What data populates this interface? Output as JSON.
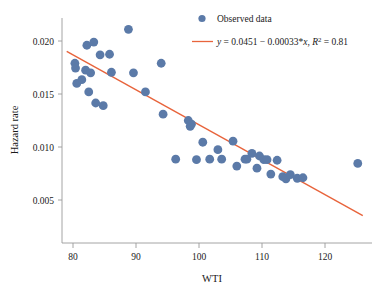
{
  "chart_data": {
    "type": "scatter",
    "title": "",
    "xlabel": "WTI",
    "ylabel": "Hazard rate",
    "xlim": [
      78.2,
      127.5
    ],
    "ylim": [
      0.0035,
      0.0215
    ],
    "grid": false,
    "legend_position": "top-right",
    "xticks": [
      80,
      90,
      100,
      110,
      120
    ],
    "xtick_labels": [
      "80",
      "90",
      "100",
      "110",
      "120"
    ],
    "yticks": [
      0.005,
      0.01,
      0.015,
      0.02
    ],
    "ytick_labels": [
      "0.005",
      "0.010",
      "0.015",
      "0.020"
    ],
    "series": [
      {
        "name": "Observed data",
        "type": "scatter",
        "color": "#5b7aa8",
        "marker": "circle",
        "marker_size": 4.4,
        "points": [
          [
            80.3,
            0.0179
          ],
          [
            80.4,
            0.01745
          ],
          [
            80.6,
            0.016
          ],
          [
            81.4,
            0.01635
          ],
          [
            82.0,
            0.01725
          ],
          [
            82.2,
            0.0196
          ],
          [
            82.5,
            0.0152
          ],
          [
            82.8,
            0.017
          ],
          [
            83.3,
            0.0199
          ],
          [
            83.6,
            0.01415
          ],
          [
            84.3,
            0.0187
          ],
          [
            84.8,
            0.0139
          ],
          [
            85.8,
            0.01875
          ],
          [
            86.1,
            0.01705
          ],
          [
            88.8,
            0.0211
          ],
          [
            89.6,
            0.017
          ],
          [
            91.5,
            0.0152
          ],
          [
            94.0,
            0.0179
          ],
          [
            94.3,
            0.0131
          ],
          [
            96.3,
            0.00885
          ],
          [
            98.3,
            0.0125
          ],
          [
            98.6,
            0.01195
          ],
          [
            98.8,
            0.01215
          ],
          [
            99.6,
            0.0088
          ],
          [
            100.6,
            0.01045
          ],
          [
            101.7,
            0.00885
          ],
          [
            103.0,
            0.00975
          ],
          [
            103.6,
            0.00885
          ],
          [
            105.4,
            0.01055
          ],
          [
            106.0,
            0.0082
          ],
          [
            107.3,
            0.00885
          ],
          [
            107.6,
            0.00885
          ],
          [
            108.4,
            0.0094
          ],
          [
            109.2,
            0.008
          ],
          [
            109.6,
            0.00915
          ],
          [
            110.3,
            0.0088
          ],
          [
            110.8,
            0.0088
          ],
          [
            111.4,
            0.00745
          ],
          [
            112.4,
            0.00875
          ],
          [
            113.3,
            0.0072
          ],
          [
            113.8,
            0.007
          ],
          [
            114.5,
            0.0074
          ],
          [
            115.6,
            0.00705
          ],
          [
            116.5,
            0.0071
          ],
          [
            125.2,
            0.00845
          ]
        ]
      },
      {
        "name": "y = 0.0451 − 0.00033*x, R² = 0.81",
        "type": "line",
        "color": "#e8643c",
        "intercept": 0.0451,
        "slope": -0.00033,
        "r_squared": 0.81,
        "x_range": [
          79.0,
          126.0
        ]
      }
    ]
  },
  "legend": {
    "observed_label": "Observed data",
    "fit_label_y": "y",
    "fit_label_eq": " = 0.0451 − 0.00033*",
    "fit_label_x": "x",
    "fit_label_comma": ", ",
    "fit_label_r": "R",
    "fit_label_sup": "2",
    "fit_label_val": " = 0.81"
  },
  "colors": {
    "marker": "#5b7aa8",
    "line": "#e8643c",
    "axis": "#9a9a9a",
    "text": "#1a1a1a",
    "background": "#ffffff"
  }
}
